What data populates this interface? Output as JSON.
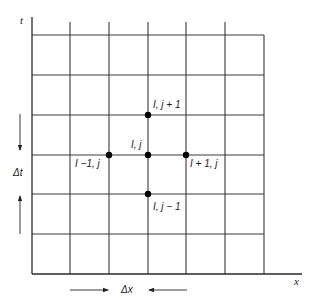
{
  "diagram": {
    "type": "finite-difference grid",
    "axes": {
      "vertical": "t",
      "horizontal": "x"
    },
    "spacing_labels": {
      "time_step": "Δt",
      "space_step": "Δx"
    },
    "grid": {
      "columns": 6,
      "rows": 6
    },
    "nodes": [
      {
        "id": "center",
        "label": "I, j"
      },
      {
        "id": "up",
        "label": "I, j + 1"
      },
      {
        "id": "down",
        "label": "I, j − 1"
      },
      {
        "id": "left",
        "label": "I −1, j"
      },
      {
        "id": "right",
        "label": "I + 1, j"
      }
    ],
    "colors": {
      "line": "#3a3a3a",
      "node": "#000000",
      "background": "#ffffff"
    }
  }
}
